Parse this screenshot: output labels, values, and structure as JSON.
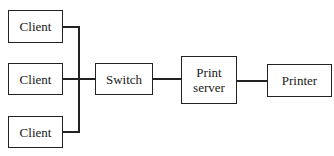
{
  "diagram": {
    "type": "network topology",
    "nodes": {
      "client_1": "Client",
      "client_2": "Client",
      "client_3": "Client",
      "switch": "Switch",
      "print_server": "Print\nserver",
      "printer": "Printer"
    },
    "print_server_lines": [
      "Print",
      "server"
    ],
    "edges": [
      [
        "client_1",
        "switch"
      ],
      [
        "client_2",
        "switch"
      ],
      [
        "client_3",
        "switch"
      ],
      [
        "switch",
        "print_server"
      ],
      [
        "print_server",
        "printer"
      ]
    ]
  }
}
